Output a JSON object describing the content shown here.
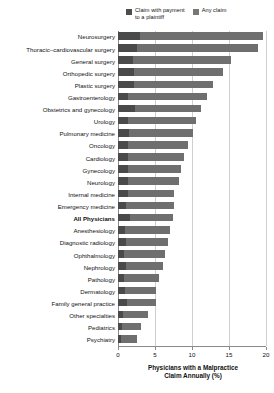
{
  "chart_data": {
    "type": "bar",
    "orientation": "horizontal",
    "title": "",
    "xlabel": "Physicians with a Malpractice\nClaim Annually (%)",
    "ylabel": "",
    "xlim": [
      0,
      20
    ],
    "xticks": [
      0,
      5,
      10,
      15,
      20
    ],
    "xtick_labels": [
      "0",
      "5",
      "10",
      "15",
      "20"
    ],
    "grid": true,
    "grid_axis": "x",
    "legend_position": "top-right",
    "categories": [
      "Neurosurgery",
      "Thoracic–cardiovascular surgery",
      "General surgery",
      "Orthopedic surgery",
      "Plastic surgery",
      "Gastroenterology",
      "Obstetrics and gynecology",
      "Urology",
      "Pulmonary medicine",
      "Oncology",
      "Cardiology",
      "Gynecology",
      "Neurology",
      "Internal medicine",
      "Emergency medicine",
      "All Physicians",
      "Anesthesiology",
      "Diagnostic radiology",
      "Ophthalmology",
      "Nephrology",
      "Pathology",
      "Dermatology",
      "Family general practice",
      "Other specialties",
      "Pediatrics",
      "Psychiatry"
    ],
    "emphasized_category": "All Physicians",
    "series": [
      {
        "name": "Any claim",
        "color": "#6f6f6f",
        "values": [
          19.6,
          18.9,
          15.3,
          14.2,
          12.8,
          12.0,
          11.2,
          10.5,
          10.2,
          9.4,
          8.9,
          8.5,
          8.2,
          7.6,
          7.5,
          7.4,
          7.0,
          6.7,
          6.3,
          6.1,
          5.5,
          5.2,
          5.2,
          4.0,
          3.1,
          2.6
        ]
      },
      {
        "name": "Claim with payment\nto a plaintiff",
        "color": "#4a4a4a",
        "values": [
          3.0,
          2.6,
          2.0,
          2.1,
          2.1,
          1.4,
          2.3,
          1.3,
          1.5,
          1.4,
          1.4,
          1.3,
          1.4,
          1.4,
          1.1,
          1.6,
          1.0,
          1.1,
          0.8,
          1.1,
          0.8,
          0.9,
          1.2,
          0.7,
          0.6,
          0.4
        ]
      }
    ]
  },
  "legend": {
    "entries": [
      {
        "label": "Claim with payment\nto a plaintiff",
        "swatch": "dark"
      },
      {
        "label": "Any claim",
        "swatch": "light"
      }
    ]
  },
  "axis": {
    "x_title": "Physicians with a Malpractice\nClaim Annually (%)"
  },
  "colors": {
    "claim_with_payment": "#4a4a4a",
    "any_claim": "#6f6f6f",
    "gridline": "#cfcfcf",
    "axis": "#8a8a8a",
    "text": "#111111",
    "background": "#ffffff"
  }
}
